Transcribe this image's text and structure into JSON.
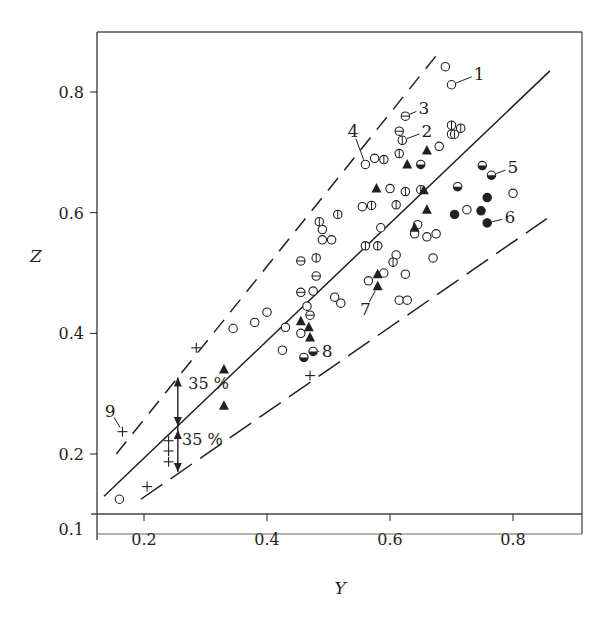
{
  "chart_data": {
    "type": "scatter",
    "title": "",
    "xlabel": "Y",
    "ylabel": "Z",
    "xlim": [
      0.125,
      0.9
    ],
    "ylim": [
      0.1,
      0.9
    ],
    "xticks": [
      0.2,
      0.4,
      0.6,
      0.8
    ],
    "xtick_labels": [
      "0.2",
      "0.4",
      "0.6",
      "0.8"
    ],
    "yticks": [
      0.1,
      0.2,
      0.4,
      0.6,
      0.8
    ],
    "ytick_labels": [
      "0.1",
      "0.2",
      "0.4",
      "0.6",
      "0.8"
    ],
    "grid": false,
    "legend": null,
    "lines": [
      {
        "name": "central fit",
        "style": "solid",
        "points": [
          [
            0.135,
            0.13
          ],
          [
            0.86,
            0.835
          ]
        ]
      },
      {
        "name": "upper bound +35 %",
        "style": "dashed",
        "points": [
          [
            0.155,
            0.2
          ],
          [
            0.675,
            0.86
          ]
        ]
      },
      {
        "name": "lower bound -35 %",
        "style": "longdash",
        "points": [
          [
            0.195,
            0.125
          ],
          [
            0.855,
            0.59
          ]
        ]
      }
    ],
    "series": [
      {
        "name": "open circle",
        "marker": "circle-open",
        "points": [
          [
            0.16,
            0.125
          ],
          [
            0.345,
            0.408
          ],
          [
            0.38,
            0.418
          ],
          [
            0.4,
            0.435
          ],
          [
            0.425,
            0.372
          ],
          [
            0.43,
            0.41
          ],
          [
            0.455,
            0.4
          ],
          [
            0.465,
            0.445
          ],
          [
            0.475,
            0.47
          ],
          [
            0.49,
            0.555
          ],
          [
            0.49,
            0.572
          ],
          [
            0.505,
            0.555
          ],
          [
            0.51,
            0.46
          ],
          [
            0.52,
            0.45
          ],
          [
            0.555,
            0.61
          ],
          [
            0.56,
            0.68
          ],
          [
            0.565,
            0.487
          ],
          [
            0.575,
            0.69
          ],
          [
            0.585,
            0.575
          ],
          [
            0.59,
            0.5
          ],
          [
            0.6,
            0.64
          ],
          [
            0.61,
            0.53
          ],
          [
            0.615,
            0.455
          ],
          [
            0.625,
            0.498
          ],
          [
            0.628,
            0.455
          ],
          [
            0.64,
            0.565
          ],
          [
            0.645,
            0.58
          ],
          [
            0.66,
            0.56
          ],
          [
            0.67,
            0.525
          ],
          [
            0.675,
            0.565
          ],
          [
            0.68,
            0.71
          ],
          [
            0.69,
            0.842
          ],
          [
            0.7,
            0.812
          ],
          [
            0.7,
            0.73
          ],
          [
            0.725,
            0.605
          ],
          [
            0.8,
            0.632
          ]
        ]
      },
      {
        "name": "circle with vertical bar",
        "marker": "circle-vbar",
        "points": [
          [
            0.48,
            0.525
          ],
          [
            0.485,
            0.585
          ],
          [
            0.515,
            0.597
          ],
          [
            0.56,
            0.545
          ],
          [
            0.57,
            0.612
          ],
          [
            0.58,
            0.545
          ],
          [
            0.605,
            0.518
          ],
          [
            0.59,
            0.688
          ],
          [
            0.61,
            0.613
          ],
          [
            0.615,
            0.698
          ],
          [
            0.62,
            0.72
          ],
          [
            0.625,
            0.635
          ],
          [
            0.65,
            0.638
          ],
          [
            0.7,
            0.745
          ],
          [
            0.705,
            0.73
          ],
          [
            0.715,
            0.74
          ]
        ]
      },
      {
        "name": "circle with horizontal bar",
        "marker": "circle-hbar",
        "points": [
          [
            0.455,
            0.52
          ],
          [
            0.455,
            0.468
          ],
          [
            0.48,
            0.495
          ],
          [
            0.47,
            0.43
          ],
          [
            0.615,
            0.735
          ],
          [
            0.625,
            0.76
          ]
        ]
      },
      {
        "name": "half-filled circle",
        "marker": "circle-half",
        "points": [
          [
            0.46,
            0.36
          ],
          [
            0.475,
            0.37
          ],
          [
            0.65,
            0.68
          ],
          [
            0.71,
            0.643
          ],
          [
            0.75,
            0.678
          ],
          [
            0.765,
            0.662
          ]
        ]
      },
      {
        "name": "filled circle",
        "marker": "circle-filled",
        "points": [
          [
            0.705,
            0.597
          ],
          [
            0.748,
            0.603
          ],
          [
            0.758,
            0.625
          ],
          [
            0.758,
            0.583
          ]
        ]
      },
      {
        "name": "filled triangle",
        "marker": "triangle",
        "points": [
          [
            0.33,
            0.34
          ],
          [
            0.33,
            0.28
          ],
          [
            0.455,
            0.42
          ],
          [
            0.468,
            0.41
          ],
          [
            0.47,
            0.393
          ],
          [
            0.578,
            0.64
          ],
          [
            0.58,
            0.498
          ],
          [
            0.58,
            0.478
          ],
          [
            0.628,
            0.68
          ],
          [
            0.64,
            0.575
          ],
          [
            0.655,
            0.637
          ],
          [
            0.66,
            0.605
          ],
          [
            0.66,
            0.703
          ]
        ]
      },
      {
        "name": "cross (9)",
        "marker": "plus",
        "points": [
          [
            0.165,
            0.237
          ],
          [
            0.205,
            0.146
          ],
          [
            0.24,
            0.222
          ],
          [
            0.24,
            0.205
          ],
          [
            0.24,
            0.187
          ],
          [
            0.285,
            0.376
          ],
          [
            0.47,
            0.33
          ]
        ]
      }
    ],
    "annotations": [
      {
        "text": "1",
        "target": [
          0.7,
          0.812
        ],
        "label_at": [
          0.745,
          0.83
        ]
      },
      {
        "text": "2",
        "target": [
          0.62,
          0.72
        ],
        "label_at": [
          0.66,
          0.735
        ]
      },
      {
        "text": "3",
        "target": [
          0.625,
          0.76
        ],
        "label_at": [
          0.655,
          0.773
        ]
      },
      {
        "text": "4",
        "target": [
          0.56,
          0.68
        ],
        "label_at": [
          0.54,
          0.735
        ]
      },
      {
        "text": "5",
        "target": [
          0.765,
          0.662
        ],
        "label_at": [
          0.8,
          0.675
        ]
      },
      {
        "text": "6",
        "target": [
          0.758,
          0.583
        ],
        "label_at": [
          0.795,
          0.592
        ]
      },
      {
        "text": "7",
        "target": [
          0.58,
          0.478
        ],
        "label_at": [
          0.56,
          0.44
        ]
      },
      {
        "text": "8",
        "target": [
          0.475,
          0.37
        ],
        "label_at": [
          0.498,
          0.37
        ]
      },
      {
        "text": "9",
        "target": [
          0.165,
          0.237
        ],
        "label_at": [
          0.145,
          0.272
        ]
      }
    ],
    "band_labels": [
      {
        "text": "35 %",
        "at": [
          0.305,
          0.317
        ]
      },
      {
        "text": "35 %",
        "at": [
          0.295,
          0.225
        ]
      }
    ],
    "band_arrow": {
      "x": 0.255,
      "top": 0.327,
      "middle": 0.243,
      "bottom": 0.17
    }
  },
  "frame": {
    "left": 97,
    "top": 32,
    "right": 582,
    "bottom": 534
  },
  "axis_map": {
    "x0": 0.2,
    "px0": 144,
    "x1": 0.8,
    "px1": 513,
    "y0": 0.2,
    "py0": 454,
    "y1": 0.8,
    "py1": 92,
    "xaxis_py": 514
  },
  "labels": {
    "x_axis": "Y",
    "y_axis": "Z"
  }
}
